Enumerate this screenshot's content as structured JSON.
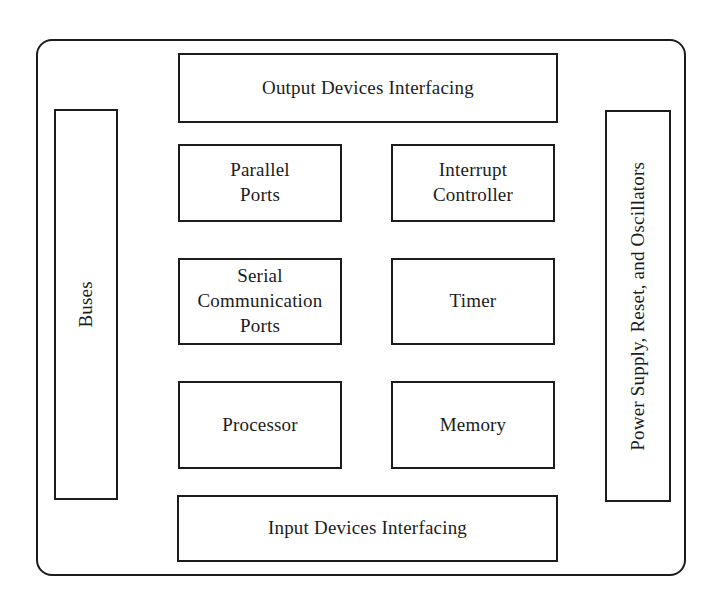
{
  "diagram": {
    "type": "block-diagram",
    "colors": {
      "line": "#1c1c1c",
      "background": "#ffffff"
    },
    "blocks": {
      "output_devices": {
        "label": "Output Devices Interfacing"
      },
      "buses": {
        "label": "Buses",
        "orientation": "vertical"
      },
      "power_supply": {
        "label": "Power Supply, Reset, and Oscillators",
        "orientation": "vertical"
      },
      "parallel_ports": {
        "label": [
          "Parallel",
          "Ports"
        ]
      },
      "interrupt_ctrl": {
        "label": [
          "Interrupt",
          "Controller"
        ]
      },
      "serial_ports": {
        "label": [
          "Serial",
          "Communication",
          "Ports"
        ]
      },
      "timer": {
        "label": "Timer"
      },
      "processor": {
        "label": "Processor"
      },
      "memory": {
        "label": "Memory"
      },
      "input_devices": {
        "label": "Input Devices Interfacing"
      }
    }
  }
}
